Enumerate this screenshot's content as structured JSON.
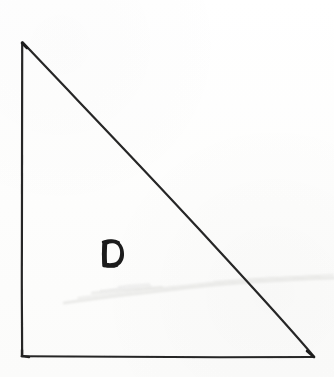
{
  "figure": {
    "kind": "hand-drawn-geometry-sketch",
    "medium": "ink on white paper, scanned",
    "shape_name": "right triangle",
    "label_text": "D",
    "background_color": "#fdfdfc",
    "ink_color": "#262626",
    "ink_color_light": "#3a3a3a",
    "smudge_color": "#e8e8e6",
    "canvas": {
      "width": 334,
      "height": 377
    },
    "vertices": [
      {
        "name": "apex",
        "position": "top-left",
        "x": 22,
        "y": 42
      },
      {
        "name": "right-angle",
        "position": "bottom-left",
        "x": 22,
        "y": 356
      },
      {
        "name": "base-end",
        "position": "bottom-right",
        "x": 314,
        "y": 357
      }
    ],
    "edges": [
      {
        "name": "left-leg",
        "orientation": "vertical",
        "from": "apex",
        "to": "right-angle",
        "stroke_width": 2.2
      },
      {
        "name": "bottom-leg",
        "orientation": "horizontal",
        "from": "right-angle",
        "to": "base-end",
        "stroke_width": 2.0
      },
      {
        "name": "hypotenuse",
        "orientation": "diagonal",
        "from": "apex",
        "to": "base-end",
        "stroke_width": 2.2
      }
    ],
    "label": {
      "text": "D",
      "x": 101,
      "y": 239,
      "width": 23,
      "height": 28,
      "style": "hand-lettered bold capital, thick outline, flat left stem with curved right bowl"
    },
    "artifacts": [
      {
        "name": "paper-crease-smudge",
        "description": "faint pale grey wavy erasure/crease line crossing the sheet",
        "y_left": 300,
        "y_right": 280,
        "x_start": 62,
        "x_end": 334
      },
      {
        "name": "secondary-smudge",
        "description": "light scuff wisps below the label",
        "y": 292
      }
    ]
  }
}
